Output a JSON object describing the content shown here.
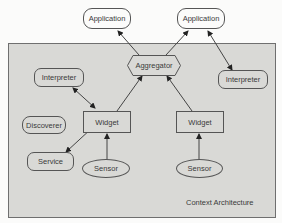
{
  "diagram": {
    "title": "Context Architecture",
    "nodes": {
      "application_left": "Application",
      "application_right": "Application",
      "aggregator": "Aggregator",
      "interpreter_left": "Interpreter",
      "interpreter_right": "Interpreter",
      "discoverer": "Discoverer",
      "widget_left": "Widget",
      "widget_right": "Widget",
      "service": "Service",
      "sensor_left": "Sensor",
      "sensor_right": "Sensor"
    },
    "edges": [
      {
        "from": "aggregator",
        "to": "application_left",
        "type": "directed"
      },
      {
        "from": "aggregator",
        "to": "application_right",
        "type": "directed"
      },
      {
        "from": "application_right",
        "to": "interpreter_right",
        "type": "bidirectional"
      },
      {
        "from": "interpreter_left",
        "to": "widget_left",
        "type": "bidirectional"
      },
      {
        "from": "widget_left",
        "to": "aggregator",
        "type": "directed"
      },
      {
        "from": "widget_right",
        "to": "aggregator",
        "type": "directed"
      },
      {
        "from": "widget_left",
        "to": "service",
        "type": "bidirectional"
      },
      {
        "from": "sensor_left",
        "to": "widget_left",
        "type": "directed"
      },
      {
        "from": "sensor_right",
        "to": "widget_right",
        "type": "directed"
      }
    ],
    "colors": {
      "background": "#d9d9d6",
      "border": "#555555",
      "text": "#3a3a3a"
    }
  }
}
